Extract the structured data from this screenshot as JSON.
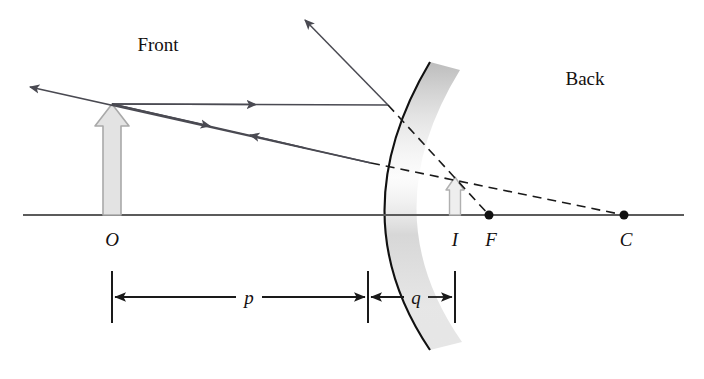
{
  "figure": {
    "width": 704,
    "height": 379,
    "background_color": "#ffffff"
  },
  "labels": {
    "front": "Front",
    "back": "Back",
    "object_point": "O",
    "image_point": "I",
    "focal_point": "F",
    "center_point": "C",
    "object_distance": "p",
    "image_distance": "q"
  },
  "colors": {
    "axis": "#5b5b5b",
    "ray": "#4a4a52",
    "dashed": "#1a1a1a",
    "mirror_outline": "#111111",
    "mirror_band_light": "#f2f2f2",
    "mirror_band_dark": "#b9b9b9",
    "arrow_fill": "#e3e3e3",
    "arrow_stroke": "#a9a9a9",
    "text": "#14100f",
    "dimension": "#1a1a1a"
  },
  "geometry": {
    "principal_axis": {
      "x1": 23,
      "y1": 215,
      "x2": 684,
      "y2": 215
    },
    "object_arrow": {
      "x": 112,
      "base_y": 215,
      "tip_y": 104,
      "width": 18
    },
    "image_arrow": {
      "x": 455,
      "base_y": 215,
      "tip_y": 177,
      "width": 11
    },
    "mirror_vertex": {
      "x": 368,
      "y": 215
    },
    "mirror_arc": {
      "top_x": 430,
      "top_y": 62,
      "bottom_x": 430,
      "bottom_y": 350
    },
    "focal_point_dot": {
      "x": 489,
      "y": 215,
      "r": 4.5
    },
    "center_point_dot": {
      "x": 624,
      "y": 215,
      "r": 4.5
    },
    "ray_parallel": {
      "from_x": 112,
      "from_y": 104,
      "hit_x": 388,
      "hit_y": 105,
      "reflect_x": 305,
      "reflect_y": 20
    },
    "ray_to_center": {
      "from_x": 112,
      "from_y": 104,
      "hit_x": 371,
      "hit_y": 163,
      "reflect_x": 30,
      "reflect_y": 87
    },
    "dimension_line_y": 297,
    "dimension_tick_top": 271,
    "dimension_tick_bottom": 323,
    "dim_tick_object": 112,
    "dim_tick_mirror": 368,
    "dim_tick_image": 455,
    "p_label": {
      "x": 247,
      "y": 303
    },
    "q_label": {
      "x": 415,
      "y": 303
    }
  },
  "annotations": {
    "description": "A convex (diverging) mirror with object O in front, virtual image I behind the mirror, focal point F and center of curvature C behind the mirror. Two rays from the object tip reflect off the mirror; dashed extensions converge behind the mirror at the image tip."
  }
}
